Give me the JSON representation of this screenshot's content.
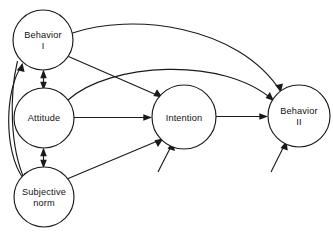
{
  "diagram": {
    "type": "path-diagram",
    "background_color": "#ffffff",
    "stroke_color": "#1a1a1a",
    "text_color": "#111111",
    "nodes": [
      {
        "id": "behavior-i",
        "label_line1": "Behavior",
        "label_line2": "I",
        "cx": 43,
        "cy": 40,
        "r": 30
      },
      {
        "id": "attitude",
        "label_line1": "Attitude",
        "label_line2": "",
        "cx": 44,
        "cy": 118,
        "r": 30
      },
      {
        "id": "subjective-norm",
        "label_line1": "Subjective",
        "label_line2": "norm",
        "cx": 44,
        "cy": 197,
        "r": 30
      },
      {
        "id": "intention",
        "label_line1": "Intention",
        "label_line2": "",
        "cx": 184,
        "cy": 117,
        "r": 32
      },
      {
        "id": "behavior-ii",
        "label_line1": "Behavior",
        "label_line2": "II",
        "cx": 299,
        "cy": 116,
        "r": 31
      }
    ],
    "edges": [
      {
        "id": "behavior-i-to-behavior-ii",
        "from": "behavior-i",
        "to": "behavior-ii",
        "style": "curved",
        "arrow": "single"
      },
      {
        "id": "attitude-to-behavior-ii",
        "from": "attitude",
        "to": "behavior-ii",
        "style": "curved",
        "arrow": "single"
      },
      {
        "id": "behavior-i-to-intention",
        "from": "behavior-i",
        "to": "intention",
        "style": "straight",
        "arrow": "single"
      },
      {
        "id": "attitude-to-intention",
        "from": "attitude",
        "to": "intention",
        "style": "straight",
        "arrow": "single"
      },
      {
        "id": "subjective-norm-to-intention",
        "from": "subjective-norm",
        "to": "intention",
        "style": "straight",
        "arrow": "single"
      },
      {
        "id": "intention-to-behavior-ii",
        "from": "intention",
        "to": "behavior-ii",
        "style": "straight",
        "arrow": "single"
      },
      {
        "id": "behavior-i-attitude",
        "from": "behavior-i",
        "to": "attitude",
        "style": "straight",
        "arrow": "double"
      },
      {
        "id": "attitude-subjective-norm",
        "from": "attitude",
        "to": "subjective-norm",
        "style": "straight",
        "arrow": "double"
      },
      {
        "id": "subjective-norm-to-behavior-i",
        "from": "subjective-norm",
        "to": "behavior-i",
        "style": "curved",
        "arrow": "single"
      },
      {
        "id": "behavior-i-to-subjective-norm",
        "from": "behavior-i",
        "to": "subjective-norm",
        "style": "curved",
        "arrow": "single"
      },
      {
        "id": "external-to-intention",
        "from": "external",
        "to": "intention",
        "style": "straight",
        "arrow": "single"
      },
      {
        "id": "external-to-behavior-ii",
        "from": "external",
        "to": "behavior-ii",
        "style": "straight",
        "arrow": "single"
      }
    ]
  }
}
